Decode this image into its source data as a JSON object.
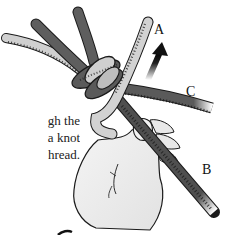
{
  "caption": {
    "lines": [
      "gh the",
      "a knot",
      "hread."
    ]
  },
  "labels": {
    "a": "A",
    "b": "B",
    "c": "C"
  },
  "colors": {
    "dark_cord": "#5a5a5a",
    "dark_cord_shade": "#3f3f3f",
    "light_cord": "#cfcfcf",
    "light_cord_shade": "#a9a9a9",
    "hand": "#eeeeee",
    "outline": "#1a1a1a",
    "arrow": "#111111"
  },
  "illustration": {
    "subject": "hand tying a knot in cord",
    "arrow_direction": "up"
  }
}
